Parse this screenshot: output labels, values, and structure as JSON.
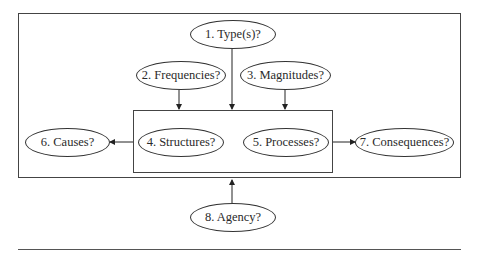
{
  "diagram": {
    "nodes": [
      {
        "id": "types",
        "label": "1. Type(s)?"
      },
      {
        "id": "frequencies",
        "label": "2. Frequencies?"
      },
      {
        "id": "magnitudes",
        "label": "3. Magnitudes?"
      },
      {
        "id": "structures",
        "label": "4. Structures?"
      },
      {
        "id": "processes",
        "label": "5. Processes?"
      },
      {
        "id": "causes",
        "label": "6. Causes?"
      },
      {
        "id": "consequences",
        "label": "7. Consequences?"
      },
      {
        "id": "agency",
        "label": "8. Agency?"
      }
    ],
    "edges": [
      {
        "from": "types",
        "to": "inner-box"
      },
      {
        "from": "frequencies",
        "to": "inner-box"
      },
      {
        "from": "magnitudes",
        "to": "inner-box"
      },
      {
        "from": "inner-box",
        "to": "causes"
      },
      {
        "from": "inner-box",
        "to": "consequences"
      },
      {
        "from": "agency",
        "to": "outer-box"
      }
    ],
    "groups": [
      {
        "id": "outer-box",
        "contains": [
          "types",
          "frequencies",
          "magnitudes",
          "structures",
          "processes",
          "causes",
          "consequences"
        ]
      },
      {
        "id": "inner-box",
        "contains": [
          "structures",
          "processes"
        ]
      }
    ]
  }
}
